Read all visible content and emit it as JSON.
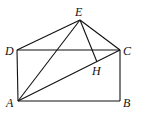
{
  "diagram": {
    "points": {
      "A": {
        "label": "A",
        "x": 18,
        "y": 101,
        "lx": 6,
        "ly": 107
      },
      "B": {
        "label": "B",
        "x": 120,
        "y": 101,
        "lx": 123,
        "ly": 107
      },
      "C": {
        "label": "C",
        "x": 120,
        "y": 50,
        "lx": 123,
        "ly": 55
      },
      "D": {
        "label": "D",
        "x": 17,
        "y": 50,
        "lx": 5,
        "ly": 55
      },
      "E": {
        "label": "E",
        "x": 80,
        "y": 20,
        "lx": 75,
        "ly": 16
      },
      "H": {
        "label": "H",
        "x": 97,
        "y": 62,
        "lx": 92,
        "ly": 75
      }
    },
    "segments": [
      [
        "D",
        "E"
      ],
      [
        "E",
        "C"
      ],
      [
        "D",
        "C"
      ],
      [
        "D",
        "A"
      ],
      [
        "A",
        "B"
      ],
      [
        "B",
        "C"
      ],
      [
        "A",
        "E"
      ],
      [
        "A",
        "C"
      ],
      [
        "E",
        "H"
      ]
    ]
  }
}
